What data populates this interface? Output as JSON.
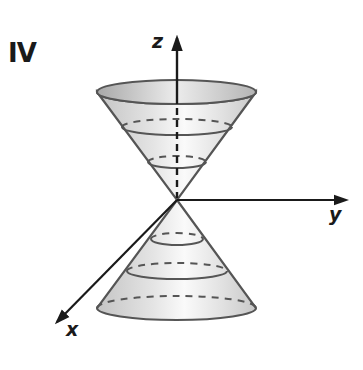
{
  "figure": {
    "panel_label": "IV",
    "axes": {
      "z": "z",
      "y": "y",
      "x": "x"
    },
    "colors": {
      "stroke": "#555555",
      "axis": "#1a1a1a",
      "fill_light": "#f2f2f2",
      "fill_dark": "#bdbdbd",
      "rim_fill": "#cfcfcf"
    }
  }
}
